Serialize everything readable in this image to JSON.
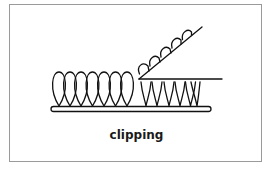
{
  "diagram": {
    "caption": "clipping",
    "elements": {
      "uncut_loops_count": 7,
      "clipped_stubs_count": 6,
      "removed_loop_tops_count": 5
    },
    "colors": {
      "stroke": "#111111",
      "border": "#9a9a9a",
      "background": "#ffffff"
    }
  }
}
